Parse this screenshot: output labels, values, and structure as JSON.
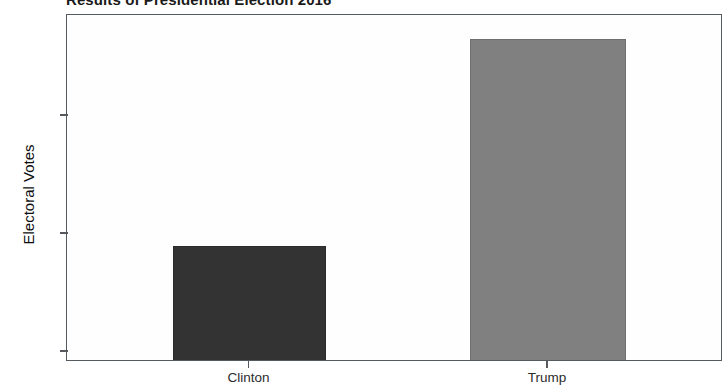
{
  "chart_data": {
    "type": "bar",
    "title": "Results of Presidential Election 2016",
    "xlabel": "",
    "ylabel": "Electoral Votes",
    "categories": [
      "Clinton",
      "Trump"
    ],
    "values": [
      236,
      306
    ],
    "series": [
      {
        "name": "Electoral Votes",
        "values": [
          236,
          306
        ]
      }
    ],
    "ylim": [
      200,
      320
    ],
    "yticks": [
      200,
      240,
      280
    ],
    "ytick_labels": [
      "200",
      "240",
      "280"
    ],
    "grid": false,
    "legend": "none",
    "bar_colors": [
      "#333333",
      "#808080"
    ],
    "bar_edge_colors": [
      "#2b2b2b",
      "#6f6f6f"
    ],
    "frame_color": "#555a5e",
    "background": "#ffffff",
    "plot_background": "#fefefe",
    "text_color": "#1a1a1a"
  }
}
